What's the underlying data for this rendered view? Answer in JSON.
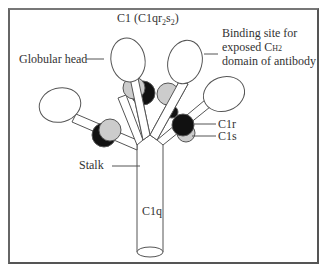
{
  "title": {
    "main": "C1 (C1qr",
    "sub2": "2",
    "mid": "s",
    "sub2b": "2",
    "close": ")"
  },
  "labels": {
    "globular_head": "Globular head",
    "binding_site_line1": "Binding site for",
    "binding_site_line2": "exposed C",
    "binding_site_h2": "H2",
    "binding_site_line3": "domain of antibody",
    "c1r": "C1r",
    "c1s": "C1s",
    "stalk": "Stalk",
    "c1q": "C1q"
  },
  "colors": {
    "outline": "#555555",
    "c1r_fill": "#111111",
    "c1s_fill": "#cccccc",
    "head_fill": "#ffffff",
    "frame": "#666666"
  }
}
